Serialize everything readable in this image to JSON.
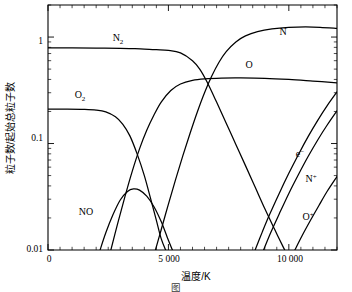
{
  "figure": {
    "caption_partial": "图",
    "background_color": "#ffffff",
    "ink_color": "#000000"
  },
  "chart_data": {
    "type": "line",
    "title": "",
    "subtitle": "",
    "xlabel": "温度/K",
    "ylabel": "粒子数/起始总粒子数",
    "xlim": [
      0,
      12000
    ],
    "ylim": [
      0.01,
      2.0
    ],
    "yscale": "log",
    "xscale": "linear",
    "grid": false,
    "legend_position": "inline-annotations",
    "x_ticks": [
      {
        "value": 0,
        "label": "0"
      },
      {
        "value": 5000,
        "label": "5 000"
      },
      {
        "value": 10000,
        "label": "10 000"
      }
    ],
    "x_minor_tick_step": 500,
    "y_ticks": [
      {
        "value": 1,
        "label": "1"
      },
      {
        "value": 0.1,
        "label": "0.1"
      },
      {
        "value": 0.01,
        "label": "0.01"
      }
    ],
    "y_minor_ticks": [
      0.02,
      0.03,
      0.04,
      0.05,
      0.06,
      0.07,
      0.08,
      0.09,
      0.2,
      0.3,
      0.4,
      0.5,
      0.6,
      0.7,
      0.8,
      0.9,
      2
    ],
    "series": [
      {
        "name": "N2",
        "label": "N₂",
        "label_text": "N",
        "label_sub": "2",
        "label_x": 3300,
        "label_y": 1.35,
        "points": [
          [
            0,
            0.79
          ],
          [
            1000,
            0.79
          ],
          [
            2000,
            0.788
          ],
          [
            3000,
            0.783
          ],
          [
            3500,
            0.778
          ],
          [
            4000,
            0.772
          ],
          [
            4500,
            0.762
          ],
          [
            5000,
            0.75
          ],
          [
            5500,
            0.71
          ],
          [
            6000,
            0.6
          ],
          [
            6300,
            0.5
          ],
          [
            6600,
            0.38
          ],
          [
            7000,
            0.245
          ],
          [
            7400,
            0.155
          ],
          [
            7800,
            0.098
          ],
          [
            8200,
            0.062
          ],
          [
            8600,
            0.039
          ],
          [
            9000,
            0.0245
          ],
          [
            9400,
            0.0158
          ],
          [
            9800,
            0.0103
          ],
          [
            10050,
            0.008
          ]
        ]
      },
      {
        "name": "O2",
        "label": "O₂",
        "label_text": "O",
        "label_sub": "2",
        "label_x": 1250,
        "label_y": 0.3,
        "points": [
          [
            0,
            0.21
          ],
          [
            800,
            0.21
          ],
          [
            1500,
            0.209
          ],
          [
            2000,
            0.206
          ],
          [
            2400,
            0.198
          ],
          [
            2800,
            0.178
          ],
          [
            3100,
            0.152
          ],
          [
            3400,
            0.118
          ],
          [
            3700,
            0.08
          ],
          [
            4000,
            0.05
          ],
          [
            4250,
            0.031
          ],
          [
            4500,
            0.019
          ],
          [
            4700,
            0.0128
          ],
          [
            4900,
            0.0098
          ]
        ]
      },
      {
        "name": "NO",
        "label": "NO",
        "label_text": "NO",
        "label_x": 1500,
        "label_y": 0.0205,
        "points": [
          [
            2150,
            0.0098
          ],
          [
            2400,
            0.0145
          ],
          [
            2700,
            0.0215
          ],
          [
            3000,
            0.0295
          ],
          [
            3300,
            0.0355
          ],
          [
            3550,
            0.0375
          ],
          [
            3800,
            0.0365
          ],
          [
            4100,
            0.032
          ],
          [
            4400,
            0.0255
          ],
          [
            4700,
            0.0185
          ],
          [
            4950,
            0.0132
          ],
          [
            5150,
            0.0102
          ],
          [
            5250,
            0.009
          ]
        ]
      },
      {
        "name": "O",
        "label": "O",
        "label_text": "O",
        "label_x": 8200,
        "label_y": 0.62,
        "points": [
          [
            2600,
            0.0098
          ],
          [
            2900,
            0.018
          ],
          [
            3200,
            0.032
          ],
          [
            3500,
            0.055
          ],
          [
            3800,
            0.089
          ],
          [
            4100,
            0.133
          ],
          [
            4400,
            0.185
          ],
          [
            4700,
            0.245
          ],
          [
            5100,
            0.315
          ],
          [
            5500,
            0.362
          ],
          [
            6000,
            0.392
          ],
          [
            6500,
            0.405
          ],
          [
            7200,
            0.412
          ],
          [
            8000,
            0.413
          ],
          [
            9000,
            0.41
          ],
          [
            10000,
            0.4
          ],
          [
            11000,
            0.386
          ],
          [
            12000,
            0.372
          ]
        ]
      },
      {
        "name": "N",
        "label": "N",
        "label_text": "N",
        "label_x": 10200,
        "label_y": 1.18,
        "points": [
          [
            4450,
            0.0098
          ],
          [
            4700,
            0.0155
          ],
          [
            5000,
            0.027
          ],
          [
            5300,
            0.046
          ],
          [
            5600,
            0.077
          ],
          [
            5900,
            0.125
          ],
          [
            6200,
            0.198
          ],
          [
            6500,
            0.3
          ],
          [
            6800,
            0.43
          ],
          [
            7100,
            0.58
          ],
          [
            7400,
            0.73
          ],
          [
            7800,
            0.9
          ],
          [
            8200,
            1.025
          ],
          [
            8700,
            1.125
          ],
          [
            9300,
            1.195
          ],
          [
            10000,
            1.235
          ],
          [
            10700,
            1.245
          ],
          [
            11300,
            1.235
          ],
          [
            12000,
            1.205
          ]
        ]
      },
      {
        "name": "e-",
        "label": "e⁻",
        "label_text": "e",
        "label_sup": "−",
        "label_x": 10350,
        "label_y": 0.072,
        "points": [
          [
            8600,
            0.01
          ],
          [
            8900,
            0.0148
          ],
          [
            9200,
            0.0215
          ],
          [
            9600,
            0.034
          ],
          [
            10000,
            0.0525
          ],
          [
            10400,
            0.079
          ],
          [
            10800,
            0.116
          ],
          [
            11200,
            0.165
          ],
          [
            11600,
            0.228
          ],
          [
            12000,
            0.305
          ]
        ]
      },
      {
        "name": "N+",
        "label": "N⁺",
        "label_text": "N",
        "label_sup": "+",
        "label_x": 10750,
        "label_y": 0.0455,
        "points": [
          [
            8950,
            0.01
          ],
          [
            9250,
            0.0146
          ],
          [
            9600,
            0.0218
          ],
          [
            10000,
            0.034
          ],
          [
            10400,
            0.0512
          ],
          [
            10800,
            0.0755
          ],
          [
            11200,
            0.108
          ],
          [
            11600,
            0.15
          ],
          [
            12000,
            0.203
          ]
        ]
      },
      {
        "name": "O+",
        "label": "O⁺",
        "label_text": "O",
        "label_sup": "+",
        "label_x": 10600,
        "label_y": 0.0185,
        "points": [
          [
            10250,
            0.01
          ],
          [
            10550,
            0.0136
          ],
          [
            10900,
            0.019
          ],
          [
            11250,
            0.0262
          ],
          [
            11600,
            0.0358
          ],
          [
            12000,
            0.049
          ]
        ]
      }
    ]
  },
  "annotations": {
    "N2": "N",
    "N2_sub": "2",
    "O2": "O",
    "O2_sub": "2",
    "NO": "NO",
    "N": "N",
    "O": "O",
    "electron": "e",
    "electron_sup": "−",
    "Nplus": "N",
    "Nplus_sup": "+",
    "Oplus": "O",
    "Oplus_sup": "+"
  },
  "axes": {
    "x_title": "温度/K",
    "y_title": "粒子数/起始总粒子数",
    "x_tick_0": "0",
    "x_tick_5000": "5 000",
    "x_tick_10000": "10 000",
    "y_tick_1": "1",
    "y_tick_0p1": "0.1",
    "y_tick_0p01": "0.01"
  }
}
